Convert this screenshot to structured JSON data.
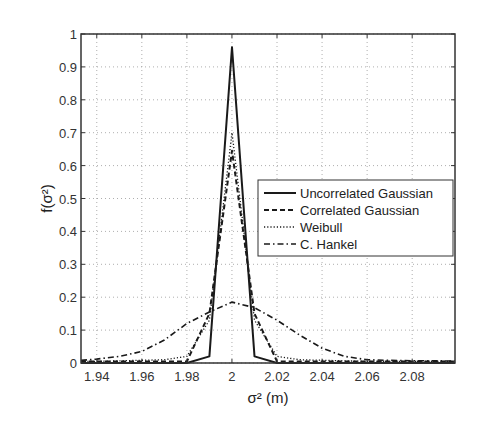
{
  "chart_data": {
    "type": "line",
    "title": "",
    "xlabel": "σ² (m)",
    "ylabel": "f(σ²)",
    "xlim": [
      1.933,
      2.099
    ],
    "ylim": [
      0,
      1
    ],
    "grid": true,
    "legend_position": "center-right",
    "x_ticks": [
      "1.94",
      "1.96",
      "1.98",
      "2",
      "2.02",
      "2.04",
      "2.06",
      "2.08"
    ],
    "y_ticks": [
      "0",
      "0.1",
      "0.2",
      "0.3",
      "0.4",
      "0.5",
      "0.6",
      "0.7",
      "0.8",
      "0.9",
      "1"
    ],
    "series": [
      {
        "name": "Uncorrelated Gaussian",
        "style": "solid",
        "x": [
          1.933,
          1.94,
          1.98,
          1.99,
          2.0,
          2.01,
          2.02,
          2.06,
          2.099
        ],
        "y": [
          0,
          0,
          0,
          0.02,
          0.96,
          0.02,
          0,
          0,
          0
        ]
      },
      {
        "name": "Correlated Gaussian",
        "style": "dashed",
        "x": [
          1.933,
          1.94,
          1.98,
          1.99,
          2.0,
          2.01,
          2.02,
          2.06,
          2.099
        ],
        "y": [
          0.005,
          0.005,
          0.005,
          0.15,
          0.645,
          0.15,
          0.005,
          0.005,
          0.005
        ]
      },
      {
        "name": "Weibull",
        "style": "dotted",
        "x": [
          1.933,
          1.94,
          1.97,
          1.98,
          1.99,
          2.0,
          2.01,
          2.02,
          2.03,
          2.06,
          2.099
        ],
        "y": [
          0.005,
          0.005,
          0.01,
          0.02,
          0.13,
          0.7,
          0.13,
          0.02,
          0.01,
          0.005,
          0.005
        ]
      },
      {
        "name": "C. Hankel",
        "style": "dashdot",
        "x": [
          1.933,
          1.94,
          1.95,
          1.96,
          1.97,
          1.98,
          1.99,
          2.0,
          2.01,
          2.02,
          2.03,
          2.04,
          2.05,
          2.06,
          2.07,
          2.08,
          2.099
        ],
        "y": [
          0.008,
          0.012,
          0.02,
          0.035,
          0.07,
          0.12,
          0.155,
          0.185,
          0.168,
          0.13,
          0.085,
          0.045,
          0.02,
          0.01,
          0.008,
          0.007,
          0.006
        ]
      }
    ]
  }
}
